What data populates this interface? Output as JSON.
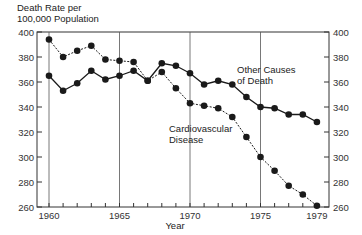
{
  "chart_data": {
    "type": "line",
    "title": "Death Rate per 100,000 Population",
    "title_lines": [
      "Death Rate per",
      "100,000 Population"
    ],
    "xlabel": "Year",
    "ylabel": "Death Rate per 100,000 Population",
    "x": [
      1960,
      1961,
      1962,
      1963,
      1964,
      1965,
      1966,
      1967,
      1968,
      1969,
      1970,
      1971,
      1972,
      1973,
      1974,
      1975,
      1976,
      1977,
      1978,
      1979
    ],
    "series": [
      {
        "name": "Other Causes of Death",
        "label_lines": [
          "Other Causes",
          "of Death"
        ],
        "style": "solid",
        "values": [
          365,
          353,
          359,
          369,
          362,
          365,
          369,
          361,
          375,
          373,
          367,
          358,
          361,
          358,
          348,
          340,
          339,
          334,
          334,
          328
        ]
      },
      {
        "name": "Cardiovascular Disease",
        "label_lines": [
          "Cardiovascular",
          "Disease"
        ],
        "style": "dashed",
        "values": [
          394,
          380,
          385,
          389,
          378,
          377,
          376,
          361,
          368,
          355,
          343,
          341,
          339,
          332,
          316,
          300,
          289,
          277,
          270,
          261
        ]
      }
    ],
    "x_tick_labels": [
      "1960",
      "1965",
      "1970",
      "1975",
      "1979"
    ],
    "y_tick_labels": [
      "260",
      "280",
      "300",
      "320",
      "340",
      "360",
      "380",
      "400"
    ],
    "ylim": [
      260,
      400
    ],
    "xlim": [
      1959.2,
      1979.8
    ],
    "grid": "vertical lines at 1960, 1965, 1970, 1975",
    "legend": "inline labels",
    "colors": {
      "line": "#1a1a1a",
      "grid": "#555555",
      "text": "#222222"
    }
  }
}
